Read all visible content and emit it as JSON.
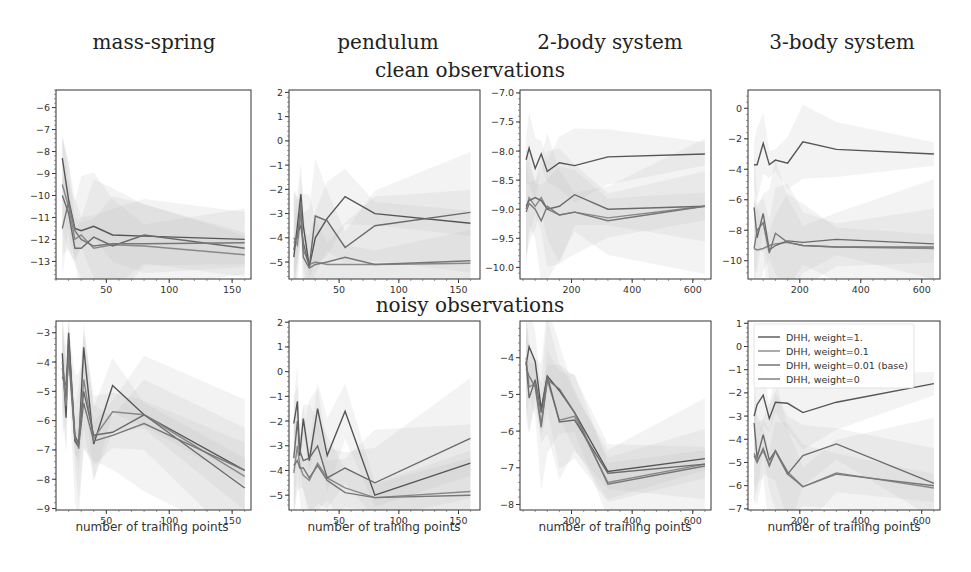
{
  "column_titles": [
    "mass-spring",
    "pendulum",
    "2-body system",
    "3-body system"
  ],
  "row_titles": [
    "clean observations",
    "noisy observations"
  ],
  "xlabel": "number of training points",
  "legend": [
    {
      "label": "DHH, weight=1.",
      "color": "#555555"
    },
    {
      "label": "DHH, weight=0.1",
      "color": "#888888"
    },
    {
      "label": "DHH, weight=0.01 (base)",
      "color": "#6a6a6a"
    },
    {
      "label": "DHH, weight=0",
      "color": "#777777"
    }
  ],
  "chart_data": [
    {
      "type": "line",
      "title": "mass-spring — clean observations",
      "xlabel": "",
      "ylabel": "",
      "xlim": [
        10,
        165
      ],
      "ylim": [
        -13.8,
        -5.2
      ],
      "xticks": [
        50,
        100,
        150
      ],
      "yticks": [
        -6,
        -7,
        -8,
        -9,
        -10,
        -11,
        -12,
        -13
      ],
      "x": [
        15,
        20,
        25,
        30,
        40,
        55,
        80,
        160
      ],
      "series": [
        {
          "name": "DHH, weight=1.",
          "values": [
            -8.3,
            -10.2,
            -11.5,
            -11.6,
            -11.4,
            -11.8,
            -11.85,
            -12.0
          ]
        },
        {
          "name": "DHH, weight=0.1",
          "values": [
            -9.5,
            -10.5,
            -12.0,
            -11.8,
            -12.4,
            -12.25,
            -12.3,
            -12.7
          ]
        },
        {
          "name": "DHH, weight=0.01 (base)",
          "values": [
            -10.0,
            -10.8,
            -12.4,
            -12.4,
            -11.9,
            -12.3,
            -11.8,
            -12.4
          ]
        },
        {
          "name": "DHH, weight=0",
          "values": [
            -11.5,
            -10.3,
            -11.6,
            -12.0,
            -12.3,
            -12.2,
            -12.2,
            -12.15
          ]
        }
      ]
    },
    {
      "type": "line",
      "title": "pendulum — clean observations",
      "xlabel": "",
      "ylabel": "",
      "xlim": [
        8,
        168
      ],
      "ylim": [
        -5.7,
        2.1
      ],
      "xticks": [
        50,
        100,
        150
      ],
      "yticks": [
        2,
        1,
        0,
        -1,
        -2,
        -3,
        -4,
        -5
      ],
      "x": [
        12,
        15,
        18,
        20,
        25,
        30,
        40,
        55,
        80,
        160
      ],
      "series": [
        {
          "name": "DHH, weight=1.",
          "values": [
            -4.8,
            -3.5,
            -2.2,
            -3.5,
            -5.2,
            -4.0,
            -3.2,
            -2.3,
            -3.0,
            -3.4
          ]
        },
        {
          "name": "DHH, weight=0.1",
          "values": [
            -4.0,
            -4.3,
            -3.0,
            -4.5,
            -5.1,
            -5.0,
            -5.1,
            -5.1,
            -5.1,
            -5.05
          ]
        },
        {
          "name": "DHH, weight=0.01 (base)",
          "values": [
            -4.5,
            -3.8,
            -3.5,
            -4.2,
            -5.2,
            -3.1,
            -3.3,
            -4.4,
            -3.5,
            -2.95
          ]
        },
        {
          "name": "DHH, weight=0",
          "values": [
            -4.2,
            -4.0,
            -2.5,
            -4.8,
            -5.25,
            -5.1,
            -5.0,
            -4.8,
            -5.1,
            -4.95
          ]
        }
      ]
    },
    {
      "type": "line",
      "title": "2-body system — clean observations",
      "xlabel": "",
      "ylabel": "",
      "xlim": [
        30,
        660
      ],
      "ylim": [
        -10.2,
        -6.95
      ],
      "xticks": [
        200,
        400,
        600
      ],
      "yticks": [
        -7.0,
        -7.5,
        -8.0,
        -8.5,
        -9.0,
        -9.5,
        -10.0
      ],
      "x": [
        50,
        60,
        80,
        100,
        120,
        160,
        210,
        320,
        640
      ],
      "series": [
        {
          "name": "DHH, weight=1.",
          "values": [
            -8.15,
            -7.95,
            -8.3,
            -8.05,
            -8.35,
            -8.2,
            -8.25,
            -8.1,
            -8.05
          ]
        },
        {
          "name": "DHH, weight=0.1",
          "values": [
            -9.0,
            -8.8,
            -8.95,
            -8.8,
            -9.0,
            -9.1,
            -9.05,
            -9.15,
            -8.95
          ]
        },
        {
          "name": "DHH, weight=0.01 (base)",
          "values": [
            -8.95,
            -8.85,
            -8.8,
            -8.85,
            -9.0,
            -8.95,
            -8.75,
            -9.0,
            -8.95
          ]
        },
        {
          "name": "DHH, weight=0",
          "values": [
            -9.05,
            -8.9,
            -9.0,
            -9.2,
            -8.95,
            -9.1,
            -9.05,
            -9.2,
            -8.95
          ]
        }
      ]
    },
    {
      "type": "line",
      "title": "3-body system — clean observations",
      "xlabel": "",
      "ylabel": "",
      "xlim": [
        30,
        660
      ],
      "ylim": [
        -11.2,
        1.2
      ],
      "xticks": [
        200,
        400,
        600
      ],
      "yticks": [
        0,
        -2,
        -4,
        -6,
        -8,
        -10
      ],
      "x": [
        50,
        60,
        80,
        100,
        120,
        160,
        210,
        320,
        640
      ],
      "series": [
        {
          "name": "DHH, weight=1.",
          "values": [
            -3.7,
            -3.7,
            -2.3,
            -3.7,
            -3.4,
            -3.6,
            -2.2,
            -2.7,
            -3.0
          ]
        },
        {
          "name": "DHH, weight=0.1",
          "values": [
            -9.2,
            -9.3,
            -9.2,
            -9.0,
            -8.9,
            -8.8,
            -9.0,
            -9.1,
            -9.2
          ]
        },
        {
          "name": "DHH, weight=0.01 (base)",
          "values": [
            -6.5,
            -8.5,
            -6.9,
            -9.3,
            -9.0,
            -8.7,
            -8.8,
            -8.6,
            -8.9
          ]
        },
        {
          "name": "DHH, weight=0",
          "values": [
            -9.2,
            -8.0,
            -7.5,
            -9.5,
            -8.2,
            -8.8,
            -9.0,
            -9.1,
            -9.1
          ]
        }
      ]
    },
    {
      "type": "line",
      "title": "mass-spring — noisy observations",
      "xlabel": "number of training points",
      "ylabel": "",
      "xlim": [
        10,
        165
      ],
      "ylim": [
        -9.05,
        -2.6
      ],
      "xticks": [
        50,
        100,
        150
      ],
      "yticks": [
        -3,
        -4,
        -5,
        -6,
        -7,
        -8,
        -9
      ],
      "x": [
        15,
        18,
        20,
        25,
        28,
        32,
        40,
        55,
        80,
        160
      ],
      "series": [
        {
          "name": "DHH, weight=1.",
          "values": [
            -3.7,
            -5.9,
            -3.0,
            -6.7,
            -6.9,
            -3.5,
            -6.8,
            -4.8,
            -5.8,
            -7.7
          ]
        },
        {
          "name": "DHH, weight=0.1",
          "values": [
            -4.2,
            -5.5,
            -3.5,
            -6.6,
            -6.7,
            -4.6,
            -6.6,
            -5.7,
            -5.8,
            -7.9
          ]
        },
        {
          "name": "DHH, weight=0.01 (base)",
          "values": [
            -4.5,
            -4.8,
            -3.2,
            -6.5,
            -6.8,
            -5.0,
            -6.5,
            -6.4,
            -5.8,
            -8.3
          ]
        },
        {
          "name": "DHH, weight=0",
          "values": [
            -4.0,
            -5.2,
            -3.8,
            -6.6,
            -6.9,
            -5.4,
            -6.7,
            -6.5,
            -6.1,
            -7.7
          ]
        }
      ]
    },
    {
      "type": "line",
      "title": "pendulum — noisy observations",
      "xlabel": "number of training points",
      "ylabel": "",
      "xlim": [
        8,
        168
      ],
      "ylim": [
        -5.6,
        2.05
      ],
      "xticks": [
        50,
        100,
        150
      ],
      "yticks": [
        2,
        1,
        0,
        -1,
        -2,
        -3,
        -4,
        -5
      ],
      "x": [
        12,
        15,
        17,
        20,
        25,
        32,
        40,
        55,
        80,
        160
      ],
      "series": [
        {
          "name": "DHH, weight=1.",
          "values": [
            -2.1,
            -1.2,
            -3.4,
            -1.9,
            -3.6,
            -1.5,
            -3.4,
            -1.6,
            -5.0,
            -3.7
          ]
        },
        {
          "name": "DHH, weight=0.1",
          "values": [
            -4.1,
            -3.0,
            -3.8,
            -4.2,
            -4.4,
            -3.7,
            -4.3,
            -4.7,
            -5.1,
            -4.85
          ]
        },
        {
          "name": "DHH, weight=0.01 (base)",
          "values": [
            -3.5,
            -2.0,
            -3.2,
            -3.6,
            -3.5,
            -3.0,
            -4.3,
            -3.9,
            -4.5,
            -2.7
          ]
        },
        {
          "name": "DHH, weight=0",
          "values": [
            -3.8,
            -3.6,
            -3.9,
            -3.9,
            -4.3,
            -3.8,
            -4.4,
            -4.9,
            -5.1,
            -5.0
          ]
        }
      ]
    },
    {
      "type": "line",
      "title": "2-body system — noisy observations",
      "xlabel": "number of training points",
      "ylabel": "",
      "xlim": [
        30,
        660
      ],
      "ylim": [
        -8.15,
        -3.0
      ],
      "xticks": [
        200,
        400,
        600
      ],
      "yticks": [
        -4,
        -5,
        -6,
        -7,
        -8
      ],
      "x": [
        50,
        60,
        80,
        100,
        120,
        160,
        210,
        320,
        640
      ],
      "series": [
        {
          "name": "DHH, weight=1.",
          "values": [
            -4.2,
            -3.7,
            -4.1,
            -5.4,
            -4.5,
            -4.9,
            -5.5,
            -7.1,
            -6.75
          ]
        },
        {
          "name": "DHH, weight=0.1",
          "values": [
            -4.0,
            -4.8,
            -4.7,
            -5.8,
            -4.6,
            -5.7,
            -5.6,
            -7.4,
            -6.9
          ]
        },
        {
          "name": "DHH, weight=0.01 (base)",
          "values": [
            -4.1,
            -5.1,
            -4.6,
            -5.5,
            -4.5,
            -5.75,
            -5.7,
            -7.15,
            -6.9
          ]
        },
        {
          "name": "DHH, weight=0",
          "values": [
            -4.3,
            -4.5,
            -4.8,
            -5.9,
            -4.6,
            -4.85,
            -5.5,
            -7.45,
            -6.95
          ]
        }
      ]
    },
    {
      "type": "line",
      "title": "3-body system — noisy observations",
      "xlabel": "number of training points",
      "ylabel": "",
      "xlim": [
        30,
        660
      ],
      "ylim": [
        -7.05,
        1.1
      ],
      "xticks": [
        200,
        400,
        600
      ],
      "yticks": [
        1,
        0,
        -1,
        -2,
        -3,
        -4,
        -5,
        -6,
        -7
      ],
      "x": [
        50,
        60,
        80,
        100,
        120,
        160,
        210,
        320,
        640
      ],
      "series": [
        {
          "name": "DHH, weight=1.",
          "values": [
            -3.0,
            -2.5,
            -2.1,
            -3.1,
            -2.4,
            -2.45,
            -2.85,
            -2.4,
            -1.6
          ]
        },
        {
          "name": "DHH, weight=0.1",
          "values": [
            -4.6,
            -4.9,
            -4.5,
            -5.1,
            -4.5,
            -5.4,
            -6.05,
            -5.45,
            -6.1
          ]
        },
        {
          "name": "DHH, weight=0.01 (base)",
          "values": [
            -3.3,
            -4.8,
            -3.8,
            -4.9,
            -4.5,
            -5.5,
            -4.7,
            -4.2,
            -5.9
          ]
        },
        {
          "name": "DHH, weight=0",
          "values": [
            -4.7,
            -5.0,
            -4.4,
            -5.15,
            -4.5,
            -5.5,
            -6.05,
            -5.5,
            -6.0
          ]
        }
      ]
    }
  ]
}
